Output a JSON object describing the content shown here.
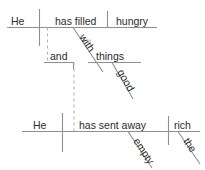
{
  "diagram": {
    "type": "reed-kellogg-sentence-diagram",
    "line_color": "#8f8f8f",
    "dashed_color": "#b4b4b4",
    "text_color": "#2b2b2b",
    "background": "#ffffff",
    "clause_top": {
      "subject": "He",
      "verb": "has filled",
      "object": "hungry",
      "modifier_phrase": {
        "preposition": "with",
        "prep_object": "things",
        "prep_object_modifier": "good"
      }
    },
    "conjunction": "and",
    "clause_bottom": {
      "subject": "He",
      "verb": "has sent away",
      "object": "rich",
      "verb_modifier": "empty",
      "object_modifier": "the"
    }
  },
  "words": {
    "he_top": "He",
    "has_filled": "has filled",
    "hungry": "hungry",
    "with": "with",
    "things": "things",
    "good": "good",
    "and": "and",
    "he_bottom": "He",
    "has_sent_away": "has sent away",
    "rich": "rich",
    "empty": "empty",
    "the": "the"
  }
}
